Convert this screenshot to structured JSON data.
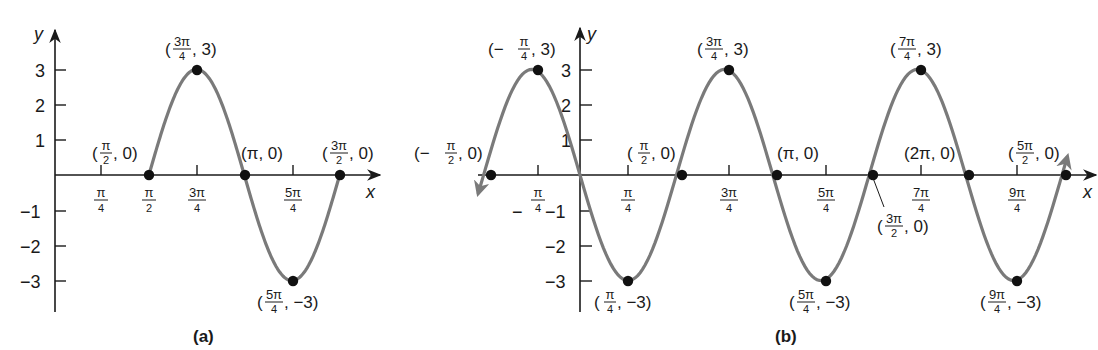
{
  "figure": {
    "function": "y = 3 sin(2x - pi)",
    "curve_color": "#7a7a7a",
    "axis_color": "#1a1a1a"
  },
  "chart_data": [
    {
      "type": "line",
      "panel": "a",
      "caption": "(a)",
      "xlabel": "x",
      "ylabel": "y",
      "description": "One period of y = 3 sin(2x - pi) on [pi/2, 3pi/2]",
      "x_ticks": [
        "π/4",
        "π/2",
        "3π/4",
        "5π/4"
      ],
      "y_ticks": [
        "3",
        "2",
        "1",
        "−1",
        "−2",
        "−3"
      ],
      "xlim": [
        0,
        1.5708
      ],
      "ylim": [
        -3.5,
        3.5
      ],
      "domain": [
        1.5708,
        4.7124
      ],
      "points": [
        {
          "x": "π/2",
          "y": 0,
          "label": "(π/2, 0)"
        },
        {
          "x": "3π/4",
          "y": 3,
          "label": "(3π/4, 3)"
        },
        {
          "x": "π",
          "y": 0,
          "label": "(π, 0)"
        },
        {
          "x": "5π/4",
          "y": -3,
          "label": "(5π/4, −3)"
        },
        {
          "x": "3π/2",
          "y": 0,
          "label": "(3π/2, 0)"
        }
      ]
    },
    {
      "type": "line",
      "panel": "b",
      "caption": "(b)",
      "xlabel": "x",
      "ylabel": "y",
      "description": "y = 3 sin(2x - pi) over [-pi/2, 5pi/2], arrows at both ends",
      "x_ticks": [
        "−π/4",
        "π/4",
        "3π/4",
        "5π/4",
        "7π/4",
        "9π/4"
      ],
      "y_ticks": [
        "3",
        "2",
        "1",
        "−1",
        "−2",
        "−3"
      ],
      "xlim": [
        -1.5708,
        7.854
      ],
      "ylim": [
        -3.5,
        3.5
      ],
      "points": [
        {
          "x": "−π/2",
          "y": 0,
          "label": "(−π/2, 0)"
        },
        {
          "x": "−π/4",
          "y": 3,
          "label": "(−π/4, 3)"
        },
        {
          "x": "π/4",
          "y": -3,
          "label": "(π/4, −3)"
        },
        {
          "x": "π/2",
          "y": 0,
          "label": "(π/2, 0)"
        },
        {
          "x": "3π/4",
          "y": 3,
          "label": "(3π/4, 3)"
        },
        {
          "x": "π",
          "y": 0,
          "label": "(π, 0)"
        },
        {
          "x": "5π/4",
          "y": -3,
          "label": "(5π/4, −3)"
        },
        {
          "x": "3π/2",
          "y": 0,
          "label": "(3π/2, 0)"
        },
        {
          "x": "7π/4",
          "y": 3,
          "label": "(7π/4, 3)"
        },
        {
          "x": "2π",
          "y": 0,
          "label": "(2π, 0)"
        },
        {
          "x": "9π/4",
          "y": -3,
          "label": "(9π/4, −3)"
        },
        {
          "x": "5π/2",
          "y": 0,
          "label": "(5π/2, 0)"
        }
      ]
    }
  ],
  "labels": {
    "a": {
      "caption": "(a)",
      "x": "x",
      "y": "y",
      "y3": "3",
      "y2": "2",
      "y1": "1",
      "ym1": "−1",
      "ym2": "−2",
      "ym3": "−3",
      "pi": "π",
      "four": "4",
      "two": "2",
      "threepi": "3π",
      "fivepi": "5π",
      "pt_open": "(",
      "pt_zero_close": ", 0)",
      "pt_three_close": ", 3)",
      "pt_m3_close": ", −3)",
      "pt_pi0": "(π, 0)"
    },
    "b": {
      "caption": "(b)",
      "x": "x",
      "y": "y",
      "y3": "3",
      "y2": "2",
      "y1": "1",
      "ym1": "−1",
      "ym2": "−2",
      "ym3": "−3",
      "pi": "π",
      "four": "4",
      "two": "2",
      "threepi": "3π",
      "fivepi": "5π",
      "sevenpi": "7π",
      "ninepi": "9π",
      "minus": "−",
      "neg_open": "(−",
      "pt_open": "(",
      "pt_zero_close": ", 0)",
      "pt_three_close": ", 3)",
      "pt_m3_close": ", −3)",
      "pt_pi0": "(π, 0)",
      "pt_2pi0": "(2π, 0)"
    }
  }
}
